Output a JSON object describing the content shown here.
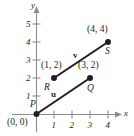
{
  "figure": {
    "type": "vector-diagram",
    "axes": {
      "x_label": "x",
      "y_label": "y",
      "x_ticks": [
        "1",
        "2",
        "3",
        "4"
      ],
      "y_ticks": [
        "1",
        "2",
        "3",
        "4",
        "5"
      ],
      "x_range": [
        0,
        5
      ],
      "y_range": [
        0,
        6
      ],
      "origin_label": "(0, 0)"
    },
    "points": [
      {
        "name": "P",
        "label": "P",
        "coord_label": "(0, 0)",
        "x": 0,
        "y": 0
      },
      {
        "name": "Q",
        "label": "Q",
        "coord_label": "(3, 2)",
        "x": 3,
        "y": 2
      },
      {
        "name": "R",
        "label": "R",
        "coord_label": "(1, 2)",
        "x": 1,
        "y": 2
      },
      {
        "name": "S",
        "label": "S",
        "coord_label": "(4, 4)",
        "x": 4,
        "y": 4
      }
    ],
    "vectors": [
      {
        "name": "u",
        "label": "u",
        "from": "P",
        "to": "Q"
      },
      {
        "name": "v",
        "label": "v",
        "from": "R",
        "to": "S"
      }
    ],
    "colors": {
      "ink": "#231f20",
      "axis": "#8c8c8c",
      "background": "#ffffff"
    }
  }
}
